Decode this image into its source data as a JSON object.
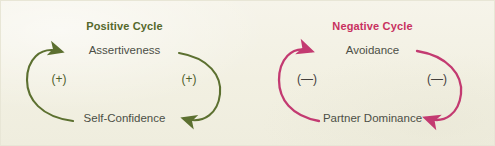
{
  "diagram": {
    "background_color": "#f4f2e6",
    "cycles": [
      {
        "id": "positive",
        "title": "Positive Cycle",
        "title_color": "#55682b",
        "arrow_color": "#5c7030",
        "node_top": "Assertiveness",
        "node_bottom": "Self-Confidence",
        "sign_left": "(+)",
        "sign_right": "(+)",
        "sign_color": "#4e5d2a",
        "node_color": "#4c4f46"
      },
      {
        "id": "negative",
        "title": "Negative Cycle",
        "title_color": "#c8315f",
        "arrow_color": "#c33a71",
        "node_top": "Avoidance",
        "node_bottom": "Partner Dominance",
        "sign_left": "(—)",
        "sign_right": "(—)",
        "sign_color": "#44403c",
        "node_color": "#4c4f46"
      }
    ],
    "icons": {
      "arrow_up_left_arc": "arc-arrow-counterclockwise-icon",
      "arrow_down_right_arc": "arc-arrow-clockwise-icon"
    }
  }
}
